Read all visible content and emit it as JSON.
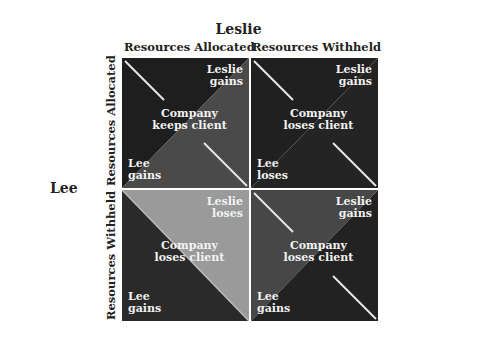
{
  "title": "Leslie",
  "columns": [
    "Resources Allocated",
    "Resources Withheld"
  ],
  "row_player": "Lee",
  "rows": [
    "Resources Allocated",
    "Resources Withheld"
  ],
  "cells": [
    {
      "leslie": "Leslie\ngains",
      "center": "Company\nkeeps client",
      "lee": "Lee\ngains",
      "upper_color": "#1e1e1e",
      "lower_color": "#4a4a4a"
    },
    {
      "leslie": "Leslie\ngains",
      "center": "Company\nloses client",
      "lee": "Lee\nloses",
      "upper_color": "#202020",
      "lower_color": "#242424"
    },
    {
      "leslie": "Leslie\nloses",
      "center": "Company\nloses client",
      "lee": "Lee\ngains",
      "upper_color": "#9a9a9a",
      "lower_color": "#2a2a2a"
    },
    {
      "leslie": "Leslie\ngains",
      "center": "Company\nloses client",
      "lee": "Lee\ngains",
      "upper_color": "#474747",
      "lower_color": "#222222"
    }
  ],
  "colors": {
    "line": "#e8e8e8",
    "text": "#f2f2f2",
    "label": "#222222"
  }
}
